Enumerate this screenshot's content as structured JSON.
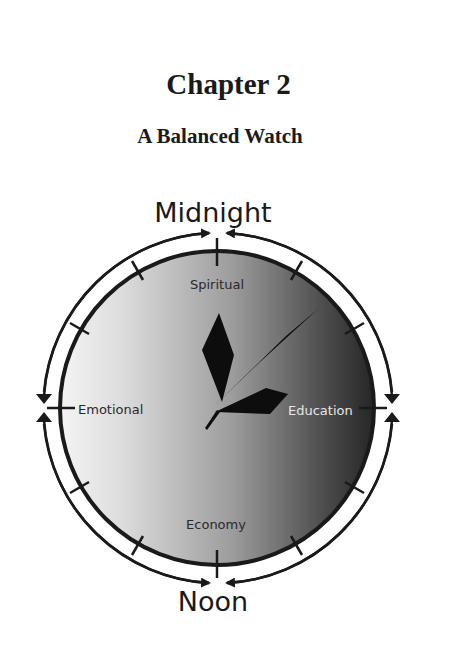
{
  "page": {
    "chapter_title": "Chapter 2",
    "chapter_subtitle": "A Balanced Watch"
  },
  "diagram": {
    "top_label": "Midnight",
    "bottom_label": "Noon",
    "quadrants": {
      "top": "Spiritual",
      "left": "Emotional",
      "right": "Education",
      "bottom": "Economy"
    },
    "colors": {
      "ink": "#1a1a1a",
      "face_light": "#f2f2f2",
      "face_mid": "#9a9a9a",
      "face_dark": "#2e2e2e",
      "education_text": "#e6e6e6"
    }
  }
}
